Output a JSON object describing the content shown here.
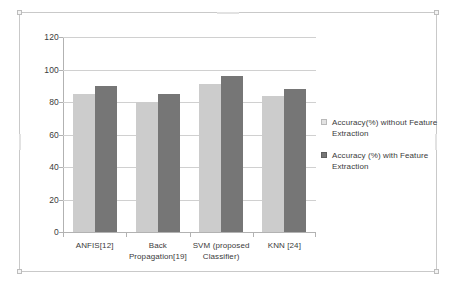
{
  "chart_data": {
    "type": "bar",
    "title": "",
    "xlabel": "",
    "ylabel": "",
    "ylim": [
      0,
      120
    ],
    "yticks": [
      0,
      20,
      40,
      60,
      80,
      100,
      120
    ],
    "grid": true,
    "legend_position": "right",
    "categories": [
      "ANFIS[12]",
      "Back Propagation[19]",
      "SVM (proposed Classifier)",
      "KNN [24]"
    ],
    "series": [
      {
        "name": "Accuracy(%) without Feature Extraction",
        "color": "#cccccc",
        "values": [
          85,
          80,
          91,
          84
        ]
      },
      {
        "name": "Accuracy (%) with Feature Extraction",
        "color": "#767676",
        "values": [
          90,
          85,
          96,
          88
        ]
      }
    ]
  },
  "axis": {
    "y_tick_labels": [
      "120",
      "100",
      "80",
      "60",
      "40",
      "20",
      "0"
    ],
    "x_tick_labels": [
      {
        "line1": "ANFIS[12]",
        "line2": ""
      },
      {
        "line1": "Back",
        "line2": "Propagation[19]"
      },
      {
        "line1": "SVM (proposed",
        "line2": "Classifier)"
      },
      {
        "line1": "KNN [24]",
        "line2": ""
      }
    ]
  },
  "legend": {
    "entries": [
      {
        "label": "Accuracy(%) without Feature Extraction",
        "swatch": "light-gray-square"
      },
      {
        "label": "Accuracy (%) with Feature Extraction",
        "swatch": "dark-gray-square"
      }
    ]
  },
  "colors": {
    "series_light": "#cccccc",
    "series_dark": "#767676",
    "gridline": "#d0d0d0",
    "axis": "#b2b2b2",
    "text": "#3b3b3b",
    "frame": "#c9c9c9"
  }
}
